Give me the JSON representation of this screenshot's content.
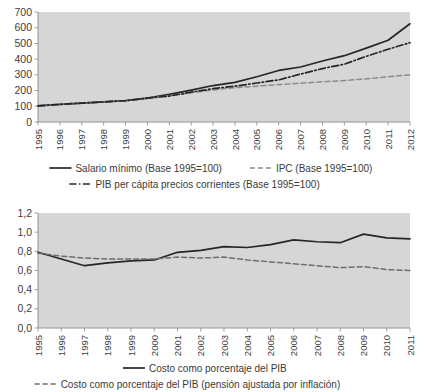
{
  "chart_data": [
    {
      "id": "top",
      "type": "line",
      "title": "",
      "xlabel": "",
      "ylabel": "",
      "ylim": [
        0,
        700
      ],
      "yticks": [
        0,
        100,
        200,
        300,
        400,
        500,
        600,
        700
      ],
      "ytick_labels": [
        "0",
        "100",
        "200",
        "300",
        "400",
        "500",
        "600",
        "700"
      ],
      "grid": false,
      "legend_position": "below",
      "categories": [
        "1995",
        "1996",
        "1997",
        "1998",
        "1999",
        "2000",
        "2001",
        "2002",
        "2003",
        "2004",
        "2005",
        "2006",
        "2007",
        "2008",
        "2009",
        "2010",
        "2011",
        "2012"
      ],
      "series": [
        {
          "name": "Salario mínimo (Base 1995=100)",
          "style": "solid",
          "color": "#262626",
          "values": [
            103,
            112,
            120,
            128,
            136,
            152,
            176,
            203,
            232,
            252,
            288,
            328,
            350,
            388,
            422,
            470,
            520,
            625
          ]
        },
        {
          "name": "IPC (Base 1995=100)",
          "style": "dashed",
          "color": "#8c8c8c",
          "values": [
            103,
            112,
            120,
            128,
            136,
            150,
            168,
            186,
            204,
            218,
            228,
            238,
            247,
            256,
            264,
            275,
            288,
            300
          ]
        },
        {
          "name": "PIB per cápita precios corrientes (Base 1995=100)",
          "style": "dashdot",
          "color": "#262626",
          "values": [
            103,
            112,
            120,
            128,
            136,
            152,
            165,
            190,
            212,
            228,
            248,
            268,
            305,
            340,
            368,
            418,
            463,
            505
          ]
        }
      ]
    },
    {
      "id": "bottom",
      "type": "line",
      "title": "",
      "xlabel": "",
      "ylabel": "",
      "ylim": [
        0.0,
        1.2
      ],
      "yticks": [
        0.0,
        0.2,
        0.4,
        0.6,
        0.8,
        1.0,
        1.2
      ],
      "ytick_labels": [
        "0,0",
        "0,2",
        "0,4",
        "0,6",
        "0,8",
        "1,0",
        "1,2"
      ],
      "grid": false,
      "legend_position": "below",
      "categories": [
        "1995",
        "1996",
        "1997",
        "1998",
        "1999",
        "2000",
        "2001",
        "2002",
        "2003",
        "2004",
        "2005",
        "2006",
        "2007",
        "2008",
        "2009",
        "2010",
        "2011"
      ],
      "series": [
        {
          "name": "Costo como porcentaje del PIB",
          "style": "solid",
          "color": "#262626",
          "values": [
            0.79,
            0.72,
            0.65,
            0.68,
            0.7,
            0.71,
            0.79,
            0.81,
            0.85,
            0.84,
            0.87,
            0.92,
            0.9,
            0.89,
            0.98,
            0.94,
            0.93
          ]
        },
        {
          "name": "Costo como porcentaje del PIB (pensión ajustada por inflación)",
          "style": "dashed",
          "color": "#6e6e6e",
          "values": [
            0.78,
            0.75,
            0.73,
            0.72,
            0.72,
            0.72,
            0.74,
            0.73,
            0.74,
            0.71,
            0.69,
            0.67,
            0.65,
            0.63,
            0.64,
            0.61,
            0.6
          ]
        }
      ]
    }
  ],
  "legends": {
    "top": [
      {
        "label": "Salario mínimo (Base 1995=100)",
        "style": "solid",
        "color": "#262626"
      },
      {
        "label": "IPC (Base 1995=100)",
        "style": "dashed",
        "color": "#8c8c8c"
      },
      {
        "label": "PIB per cápita precios corrientes (Base 1995=100)",
        "style": "dashdot",
        "color": "#262626"
      }
    ],
    "bottom": [
      {
        "label": "Costo como porcentaje del PIB",
        "style": "solid",
        "color": "#262626"
      },
      {
        "label": "Costo como porcentaje del PIB (pensión ajustada por inflación)",
        "style": "dashed",
        "color": "#6e6e6e"
      }
    ]
  },
  "colors": {
    "plot_background": "#d6d6d6",
    "page_background": "#ffffff",
    "axis": "#8a8a8a",
    "text": "#3a3a3a"
  }
}
